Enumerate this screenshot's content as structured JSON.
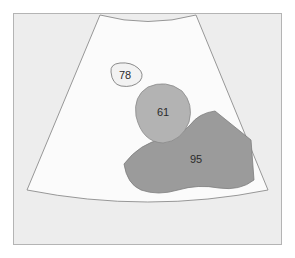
{
  "figure": {
    "name": "ultrasound-sector-scan-segmentation",
    "type": "annotated-region-diagram",
    "canvas": {
      "width": 295,
      "height": 258
    },
    "frame": {
      "name": "image-border",
      "stroke_color": "#b4b4b4",
      "fill_color": "#ffffff",
      "x": 13.5,
      "y": 13.5,
      "width": 268,
      "height": 231
    },
    "outside_scan_area": {
      "name": "scan-background",
      "fill_color": "#ededed"
    },
    "scan_sector": {
      "name": "ultrasound-scan-sector",
      "fill_color": "#fbfbfb",
      "stroke_color": "#8c8c8c",
      "path": "M 100 15 Q 148 28 196 15 L 268 190 Q 148 214 27 190 Z"
    }
  },
  "regions": [
    {
      "id": "region-78",
      "label": "78",
      "label_x": 125,
      "label_y": 76,
      "fill_color": "#f2f2f2",
      "stroke_color": "#6e6e6e",
      "path": "M 111 72 Q 110 64 120 63 Q 131 62 138 68 Q 145 74 140 81 Q 133 88 121 86 Q 112 84 111 72 Z",
      "description": "small light blob, upper-left of sector"
    },
    {
      "id": "region-61",
      "label": "61",
      "label_x": 163,
      "label_y": 113,
      "fill_color": "#b3b3b3",
      "stroke_color": "#8a8a8a",
      "path": "M 136 116 Q 133 96 148 87 Q 166 79 182 91 Q 194 104 189 122 Q 182 141 163 143 Q 142 142 136 116 Z",
      "description": "medium gray oval mass, center of sector"
    },
    {
      "id": "region-95",
      "label": "95",
      "label_x": 196,
      "label_y": 160,
      "fill_color": "#9b9b9b",
      "stroke_color": "#7d7d7d",
      "path": "M 124 164 Q 140 143 163 139 Q 180 137 190 125 Q 199 113 215 111 L 251 140 L 254 180 Q 240 191 219 188 Q 198 184 178 190 Q 158 196 141 190 Q 127 184 124 164 Z",
      "description": "large dark gray irregular mass, lower-right of sector"
    }
  ],
  "colors": {
    "frame_stroke": "#b4b4b4",
    "page_background": "#ffffff",
    "sector_background": "#fbfbfb",
    "outside_sector": "#ededed",
    "label_text": "#2b2b2b"
  }
}
